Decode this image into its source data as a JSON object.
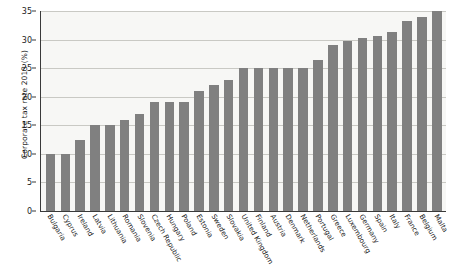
{
  "chart_data": {
    "type": "bar",
    "title": "",
    "xlabel": "",
    "ylabel": "Corporate tax rate 2013 (%)",
    "ylim": [
      0,
      35
    ],
    "yticks": [
      0,
      5,
      10,
      15,
      20,
      25,
      30,
      35
    ],
    "grid": true,
    "legend": null,
    "bar_color": "#808080",
    "plot_background": "#f7f7f5",
    "categories": [
      "Bulgaria",
      "Cyprus",
      "Ireland",
      "Latvia",
      "Lithuania",
      "Romania",
      "Slovenia",
      "Czech Republic",
      "Hungary",
      "Poland",
      "Estonia",
      "Sweden",
      "Slovakia",
      "United Kingdom",
      "Finland",
      "Austria",
      "Denmark",
      "Netherlands",
      "Portugal",
      "Greece",
      "Luxembourg",
      "Germany",
      "Spain",
      "Italy",
      "France",
      "Belgium",
      "Malta"
    ],
    "values": [
      10.0,
      10.0,
      12.5,
      15.0,
      15.0,
      16.0,
      17.0,
      19.0,
      19.0,
      19.0,
      21.0,
      22.0,
      23.0,
      25.0,
      25.0,
      25.0,
      25.0,
      25.0,
      26.5,
      29.0,
      29.8,
      30.2,
      30.7,
      31.4,
      33.3,
      34.0,
      35.0
    ]
  }
}
